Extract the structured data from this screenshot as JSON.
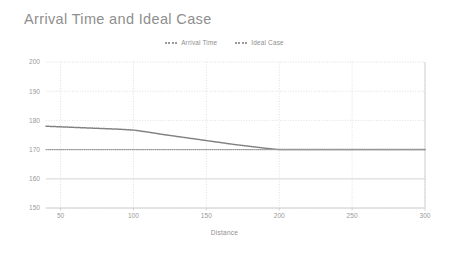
{
  "chart_data": {
    "type": "line",
    "title": "Arrival Time and Ideal Case",
    "xlabel": "Distance",
    "ylabel": "",
    "xlim": [
      40,
      300
    ],
    "ylim": [
      150,
      200
    ],
    "xticks": [
      50,
      100,
      150,
      200,
      250,
      300
    ],
    "yticks": [
      150,
      160,
      170,
      180,
      190,
      200
    ],
    "grid": true,
    "legend_position": "top-center",
    "x": [
      40,
      50,
      60,
      70,
      80,
      90,
      100,
      110,
      120,
      130,
      140,
      150,
      160,
      170,
      180,
      190,
      200,
      210,
      220,
      230,
      240,
      250,
      260,
      270,
      280,
      290,
      300
    ],
    "series": [
      {
        "name": "Arrival Time",
        "color": "#808080",
        "style": "dotted",
        "values": [
          178.0,
          177.8,
          177.6,
          177.4,
          177.2,
          177.0,
          176.7,
          176.0,
          175.2,
          174.5,
          173.8,
          173.1,
          172.4,
          171.7,
          171.1,
          170.5,
          170.0,
          170.0,
          170.0,
          170.0,
          170.0,
          170.0,
          170.0,
          170.0,
          170.0,
          170.0,
          170.0
        ]
      },
      {
        "name": "Ideal Case",
        "color": "#9a9a9a",
        "style": "dotted",
        "values": [
          170.0,
          170.0,
          170.0,
          170.0,
          170.0,
          170.0,
          170.0,
          170.0,
          170.0,
          170.0,
          170.0,
          170.0,
          170.0,
          170.0,
          170.0,
          170.0,
          170.0,
          170.0,
          170.0,
          170.0,
          170.0,
          170.0,
          170.0,
          170.0,
          170.0,
          170.0,
          170.0
        ]
      }
    ],
    "tick_labels_y": [
      "200",
      "190",
      "180",
      "170",
      "160",
      "150"
    ],
    "tick_labels_x": [
      "50",
      "100",
      "150",
      "200",
      "250",
      "300"
    ]
  },
  "legend": {
    "entries": [
      {
        "label": "Arrival Time"
      },
      {
        "label": "Ideal Case"
      }
    ]
  },
  "colors": {
    "background": "#ffffff",
    "grid": "#d8d8d8",
    "axis": "#c8c8c8",
    "text": "#8e8e8e",
    "series_primary": "#808080",
    "series_secondary": "#9a9a9a"
  }
}
